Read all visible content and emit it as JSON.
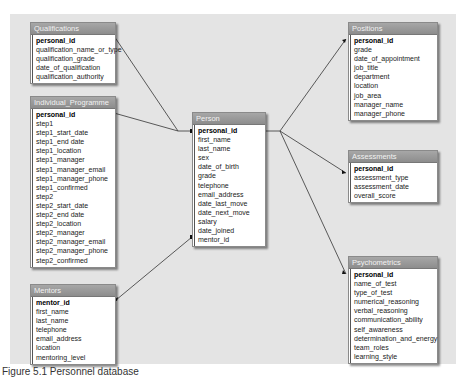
{
  "diagram": {
    "caption": "Figure 5.1  Personnel database",
    "tables": {
      "qualifications": {
        "title": "Qualifications",
        "fields": [
          "personal_id",
          "qualification_name_or_type",
          "qualification_grade",
          "date_of_qualification",
          "qualification_authority"
        ]
      },
      "individual_programme": {
        "title": "Individual_Programme",
        "fields": [
          "personal_id",
          "step1",
          "step1_start_date",
          "step1_end date",
          "step1_location",
          "step1_manager",
          "step1_manager_email",
          "step1_manager_phone",
          "step1_confirmed",
          "step2",
          "step2_start_date",
          "step2_end date",
          "step2_location",
          "step2_manager",
          "step2_manager_email",
          "step2_manager_phone",
          "step2_confirmed"
        ]
      },
      "mentors": {
        "title": "Mentors",
        "fields": [
          "mentor_id",
          "first_name",
          "last_name",
          "telephone",
          "email_address",
          "location",
          "mentoring_level"
        ]
      },
      "person": {
        "title": "Person",
        "fields": [
          "personal_id",
          "first_name",
          "last_name",
          "sex",
          "date_of_birth",
          "grade",
          "telephone",
          "email_address",
          "date_last_move",
          "date_next_move",
          "salary",
          "date_joined",
          "mentor_id"
        ]
      },
      "positions": {
        "title": "Positions",
        "fields": [
          "personal_id",
          "grade",
          "date_of_appointment",
          "job_title",
          "department",
          "location",
          "job_area",
          "manager_name",
          "manager_phone"
        ]
      },
      "assessments": {
        "title": "Assessments",
        "fields": [
          "personal_id",
          "assessment_type",
          "assessment_date",
          "overall_score"
        ]
      },
      "psychometrics": {
        "title": "Psychometrics",
        "fields": [
          "personal_id",
          "name_of_test",
          "type_of_test",
          "numerical_reasoning",
          "verbal_reasoning",
          "communication_ability",
          "self_awareness",
          "determination_and_energy",
          "team_roles",
          "learning_style"
        ]
      }
    },
    "relationships": [
      {
        "from": "person.personal_id",
        "to": "qualifications.personal_id"
      },
      {
        "from": "person.personal_id",
        "to": "individual_programme.personal_id"
      },
      {
        "from": "person.personal_id",
        "to": "positions.personal_id"
      },
      {
        "from": "person.personal_id",
        "to": "assessments.personal_id"
      },
      {
        "from": "person.personal_id",
        "to": "psychometrics.personal_id"
      },
      {
        "from": "person.mentor_id",
        "to": "mentors.mentor_id"
      }
    ]
  }
}
